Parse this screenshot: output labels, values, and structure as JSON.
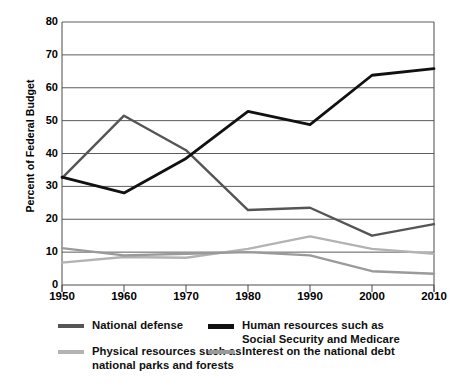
{
  "chart_data": {
    "type": "line",
    "title": "",
    "xlabel": "",
    "ylabel": "Percent of Federal Budget",
    "x": [
      1950,
      1960,
      1970,
      1980,
      1990,
      2000,
      2010
    ],
    "xtick_labels": [
      "1950",
      "1960",
      "1970",
      "1980",
      "1990",
      "2000",
      "2010"
    ],
    "ytick_labels": [
      "0",
      "10",
      "20",
      "30",
      "40",
      "50",
      "60",
      "70",
      "80"
    ],
    "yticks": [
      0,
      10,
      20,
      30,
      40,
      50,
      60,
      70,
      80
    ],
    "xlim": [
      1950,
      2010
    ],
    "ylim": [
      0,
      80
    ],
    "grid": "horizontal",
    "legend_position": "bottom",
    "series": [
      {
        "name": "National defense",
        "color": "#555555",
        "width": 2.4,
        "values": [
          32.5,
          51.5,
          41.0,
          22.8,
          23.5,
          15.0,
          18.5
        ]
      },
      {
        "name": "Human resources such as\nSocial Security and Medicare",
        "color": "#111111",
        "width": 2.8,
        "values": [
          32.8,
          28.0,
          38.5,
          52.8,
          48.8,
          63.8,
          65.8
        ]
      },
      {
        "name": "Physical resources such as\nnational parks and forests",
        "color": "#b3b3b3",
        "width": 2.4,
        "values": [
          6.8,
          8.5,
          8.3,
          11.0,
          14.8,
          11.0,
          9.5
        ]
      },
      {
        "name": "Interest on the national debt",
        "color": "#9a9a9a",
        "width": 2.4,
        "values": [
          11.2,
          9.0,
          9.5,
          10.0,
          9.0,
          4.2,
          3.4
        ]
      }
    ]
  },
  "axis": {
    "ylabel": "Percent of Federal Budget"
  },
  "legend": {
    "items": [
      {
        "label": "National defense",
        "color": "#555555"
      },
      {
        "label": "Human resources such as\nSocial Security and Medicare",
        "color": "#111111"
      },
      {
        "label": "Physical resources such as\nnational parks and forests",
        "color": "#b3b3b3"
      },
      {
        "label": "Interest on the national debt",
        "color": "#9a9a9a"
      }
    ]
  }
}
